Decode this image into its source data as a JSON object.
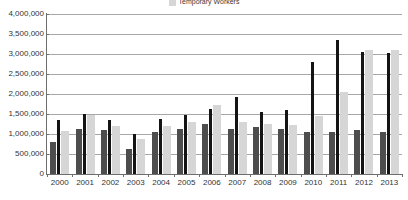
{
  "legend": {
    "items": [
      {
        "label": "Temporary Workers",
        "color": "#d6d6d6",
        "swatch_name": "legend-swatch-temporary-workers"
      }
    ]
  },
  "chart_data": {
    "type": "bar",
    "title": "",
    "subtitle": "",
    "xlabel": "",
    "ylabel": "",
    "grid": true,
    "legend_position": "top-center",
    "ylim": [
      0,
      4000000
    ],
    "ytick_values": [
      4000000,
      3500000,
      3000000,
      2500000,
      2000000,
      1500000,
      1000000,
      500000,
      0
    ],
    "ytick_labels": [
      "4,000,000",
      "3,500,000",
      "3,000,000",
      "2,500,000",
      "2,000,000",
      "1,500,000",
      "1,000,000",
      "500,000",
      "0"
    ],
    "categories": [
      "2000",
      "2001",
      "2002",
      "2003",
      "2004",
      "2005",
      "2006",
      "2007",
      "2008",
      "2009",
      "2010",
      "2011",
      "2012",
      "2013"
    ],
    "series": [
      {
        "name": "Series A",
        "color": "#4d4d4d",
        "values": [
          790000,
          1130000,
          1090000,
          620000,
          1060000,
          1130000,
          1240000,
          1130000,
          1180000,
          1130000,
          1040000,
          1060000,
          1100000,
          1060000
        ]
      },
      {
        "name": "Series B",
        "color": "#141414",
        "values": [
          1340000,
          1500000,
          1360000,
          1000000,
          1370000,
          1480000,
          1620000,
          1930000,
          1540000,
          1600000,
          2800000,
          3350000,
          3060000,
          3030000
        ]
      },
      {
        "name": "Temporary Workers",
        "color": "#d6d6d6",
        "values": [
          1080000,
          1480000,
          1200000,
          880000,
          1190000,
          1300000,
          1730000,
          1300000,
          1260000,
          1230000,
          1440000,
          2050000,
          3100000,
          3100000
        ]
      }
    ]
  }
}
